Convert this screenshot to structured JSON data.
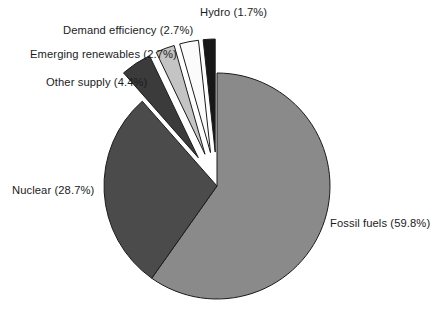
{
  "chart_data": {
    "type": "pie",
    "title": "",
    "subtitle": "",
    "xlabel": "",
    "ylabel": "",
    "legend_position": "none",
    "grid": false,
    "units": "percent",
    "total": 100.0,
    "labels": [
      "Fossil fuels",
      "Nuclear",
      "Other supply",
      "Emerging renewables",
      "Demand efficiency",
      "Hydro"
    ],
    "values": [
      59.8,
      28.7,
      4.4,
      2.7,
      2.7,
      1.7
    ],
    "slices": [
      {
        "name": "fossil-fuels",
        "label": "Fossil fuels (59.8%)",
        "value": 59.8,
        "color": "#8a8a8a",
        "exploded": false,
        "label_text": "Fossil fuels (59.8%)"
      },
      {
        "name": "nuclear",
        "label": "Nuclear (28.7%)",
        "value": 28.7,
        "color": "#4b4b4b",
        "exploded": false,
        "label_text": "Nuclear (28.7%)"
      },
      {
        "name": "other-supply",
        "label": "Other supply (4.4%)",
        "value": 4.4,
        "color": "#3b3b3b",
        "exploded": true,
        "label_text": "Other supply (4.4%)"
      },
      {
        "name": "emerging-renewables",
        "label": "Emerging renewables (2.7%)",
        "value": 2.7,
        "color": "#c4c4c4",
        "exploded": true,
        "label_text": "Emerging renewables (2.7%)"
      },
      {
        "name": "demand-efficiency",
        "label": "Demand efficiency (2.7%)",
        "value": 2.7,
        "color": "#fbfbfb",
        "exploded": true,
        "label_text": "Demand efficiency (2.7%)"
      },
      {
        "name": "hydro",
        "label": "Hydro (1.7%)",
        "value": 1.7,
        "color": "#181818",
        "exploded": true,
        "label_text": "Hydro (1.7%)"
      }
    ],
    "geometry": {
      "center_x": 217,
      "center_y": 186,
      "radius": 113,
      "start_angle_deg": -90,
      "direction": "clockwise",
      "explode_offset": 34
    },
    "style": {
      "background": "#ffffff",
      "outline_color": "#1b1b1b",
      "outline_width": 1,
      "label_color": "#1b1b1b"
    }
  }
}
